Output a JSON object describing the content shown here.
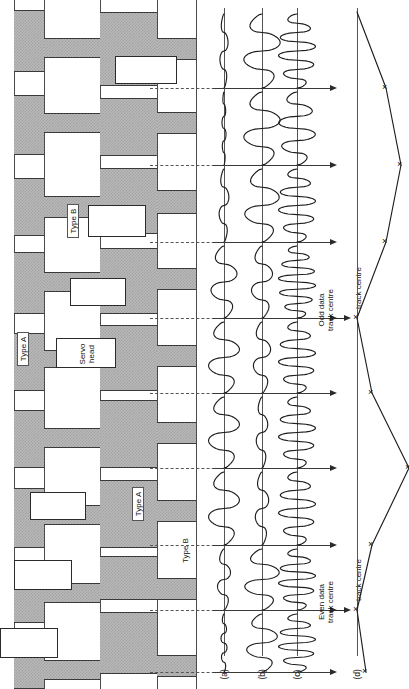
{
  "figure": {
    "orientation": "rotated-90-ccw",
    "panel_labels": [
      "(a)",
      "(b)",
      "(c)",
      "(d)"
    ],
    "annotations": {
      "servo_head": "Servo\nhead",
      "type_a_upper": "Type A",
      "type_b_upper": "Type B",
      "type_a_lower": "Type A",
      "type_b_lower": "Type B",
      "odd_track": "Odd data\ntrack centre",
      "even_track": "Even data\ntrack centre",
      "track_centre_1": "track centre",
      "track_centre_2": "track centre"
    },
    "colors": {
      "burst_fill": "#b9b9b9",
      "burst_hatch": "#a2a2a2",
      "line": "#1d1d1d",
      "dash": "#555555",
      "background": "#ffffff"
    }
  },
  "tracks": {
    "columns": [
      {
        "name": "col-1",
        "x": 14,
        "w": 30
      },
      {
        "name": "col-2",
        "x": 44,
        "w": 56
      },
      {
        "name": "col-3",
        "x": 100,
        "w": 57
      },
      {
        "name": "col-4",
        "x": 157,
        "w": 39
      }
    ],
    "rails": [
      14,
      44,
      100,
      157,
      196
    ],
    "bursts": [
      {
        "col": 0,
        "y": 10,
        "h": 62
      },
      {
        "col": 0,
        "y": 95,
        "h": 60
      },
      {
        "col": 0,
        "y": 178,
        "h": 58
      },
      {
        "col": 0,
        "y": 252,
        "h": 62
      },
      {
        "col": 0,
        "y": 333,
        "h": 58
      },
      {
        "col": 0,
        "y": 410,
        "h": 58
      },
      {
        "col": 0,
        "y": 488,
        "h": 60
      },
      {
        "col": 0,
        "y": 565,
        "h": 58
      },
      {
        "col": 0,
        "y": 645,
        "h": 44
      },
      {
        "col": 1,
        "y": 38,
        "h": 20
      },
      {
        "col": 1,
        "y": 113,
        "h": 20
      },
      {
        "col": 1,
        "y": 196,
        "h": 22
      },
      {
        "col": 1,
        "y": 272,
        "h": 20
      },
      {
        "col": 1,
        "y": 350,
        "h": 18
      },
      {
        "col": 1,
        "y": 428,
        "h": 20
      },
      {
        "col": 1,
        "y": 505,
        "h": 20
      },
      {
        "col": 1,
        "y": 583,
        "h": 20
      },
      {
        "col": 1,
        "y": 660,
        "h": 20
      },
      {
        "col": 2,
        "y": 12,
        "h": 74
      },
      {
        "col": 2,
        "y": 98,
        "h": 58
      },
      {
        "col": 2,
        "y": 168,
        "h": 66
      },
      {
        "col": 2,
        "y": 248,
        "h": 66
      },
      {
        "col": 2,
        "y": 325,
        "h": 66
      },
      {
        "col": 2,
        "y": 400,
        "h": 68
      },
      {
        "col": 2,
        "y": 480,
        "h": 68
      },
      {
        "col": 2,
        "y": 556,
        "h": 44
      },
      {
        "col": 2,
        "y": 612,
        "h": 62
      },
      {
        "col": 3,
        "y": 38,
        "h": 22
      },
      {
        "col": 3,
        "y": 112,
        "h": 22
      },
      {
        "col": 3,
        "y": 190,
        "h": 24
      },
      {
        "col": 3,
        "y": 268,
        "h": 22
      },
      {
        "col": 3,
        "y": 345,
        "h": 22
      },
      {
        "col": 3,
        "y": 422,
        "h": 22
      },
      {
        "col": 3,
        "y": 500,
        "h": 22
      },
      {
        "col": 3,
        "y": 578,
        "h": 22
      },
      {
        "col": 3,
        "y": 655,
        "h": 22
      }
    ],
    "heads": [
      {
        "x": 115,
        "y": 56,
        "w": 62,
        "h": 28
      },
      {
        "x": 88,
        "y": 205,
        "w": 58,
        "h": 32
      },
      {
        "x": 70,
        "y": 278,
        "w": 56,
        "h": 28
      },
      {
        "x": 56,
        "y": 338,
        "w": 60,
        "h": 30
      },
      {
        "x": 30,
        "y": 492,
        "w": 56,
        "h": 28
      },
      {
        "x": 14,
        "y": 560,
        "w": 58,
        "h": 30
      },
      {
        "x": 0,
        "y": 628,
        "w": 58,
        "h": 30
      }
    ]
  },
  "waveforms": {
    "axes": [
      {
        "label": "(a)",
        "x": 224
      },
      {
        "label": "(b)",
        "x": 262
      },
      {
        "label": "(c)",
        "x": 297
      }
    ],
    "baseline_x": 213,
    "arrow_y": 651,
    "bands": [
      {
        "index": 0,
        "tie_y": 88,
        "amp_a": 0.25,
        "amp_b": 0.95,
        "amp_c": 0.85,
        "cycles_a": 2,
        "cycles_b": 2,
        "cycles_c": 4
      },
      {
        "index": 1,
        "tie_y": 165,
        "amp_a": 0.12,
        "amp_b": 0.95,
        "amp_c": 0.85,
        "cycles_a": 3,
        "cycles_b": 2,
        "cycles_c": 3
      },
      {
        "index": 2,
        "tie_y": 242,
        "amp_a": 0.3,
        "amp_b": 0.9,
        "amp_c": 0.85,
        "cycles_a": 2,
        "cycles_b": 2,
        "cycles_c": 4
      },
      {
        "index": 3,
        "tie_y": 318,
        "amp_a": 0.8,
        "amp_b": 0.55,
        "amp_c": 0.85,
        "cycles_a": 2,
        "cycles_b": 2,
        "cycles_c": 5
      },
      {
        "index": 4,
        "tie_y": 393,
        "amp_a": 0.95,
        "amp_b": 0.45,
        "amp_c": 0.85,
        "cycles_a": 2,
        "cycles_b": 2,
        "cycles_c": 4
      },
      {
        "index": 5,
        "tie_y": 468,
        "amp_a": 0.95,
        "amp_b": 0.3,
        "amp_c": 0.85,
        "cycles_a": 2,
        "cycles_b": 2,
        "cycles_c": 4
      },
      {
        "index": 6,
        "tie_y": 545,
        "amp_a": 0.95,
        "amp_b": 0.35,
        "amp_c": 0.85,
        "cycles_a": 2,
        "cycles_b": 2,
        "cycles_c": 4
      },
      {
        "index": 7,
        "tie_y": 610,
        "amp_a": 0.4,
        "amp_b": 0.9,
        "amp_c": 0.85,
        "cycles_a": 2,
        "cycles_b": 2,
        "cycles_c": 4
      },
      {
        "index": 8,
        "tie_y": 672,
        "amp_a": 0.18,
        "amp_b": 0.8,
        "amp_c": 0.85,
        "cycles_a": 3,
        "cycles_b": 2,
        "cycles_c": 4
      }
    ]
  },
  "chart_data": {
    "type": "line",
    "xlabel": "",
    "ylabel": "Position error",
    "baseline_x": 357,
    "series": [
      {
        "name": "position-error",
        "points": [
          {
            "y": 12,
            "x": 357,
            "marker": false
          },
          {
            "y": 88,
            "x": 386,
            "marker": true
          },
          {
            "y": 165,
            "x": 401,
            "marker": true
          },
          {
            "y": 242,
            "x": 386,
            "marker": true
          },
          {
            "y": 318,
            "x": 357,
            "marker": true
          },
          {
            "y": 393,
            "x": 372,
            "marker": true
          },
          {
            "y": 468,
            "x": 409,
            "marker": true
          },
          {
            "y": 545,
            "x": 372,
            "marker": true
          },
          {
            "y": 610,
            "x": 357,
            "marker": true
          },
          {
            "y": 672,
            "x": 366,
            "marker": true
          }
        ]
      }
    ],
    "markers": "x",
    "grid": false,
    "legend": false,
    "annotations": [
      {
        "text": "track centre",
        "y": 318
      },
      {
        "text": "track centre",
        "y": 610
      }
    ]
  }
}
